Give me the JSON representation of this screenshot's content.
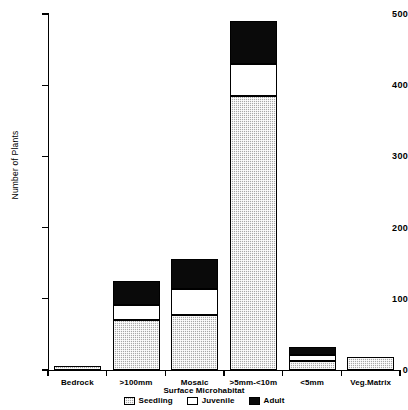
{
  "chart_data": {
    "type": "bar",
    "subtype": "stacked-bar",
    "title": "",
    "xlabel": "Surface Microhabitat",
    "ylabel": "Number of Plants",
    "categories": [
      "Bedrock",
      ">100mm",
      "Mosaic",
      ">5mm-<10m",
      "<5mm",
      "Veg.Matrix"
    ],
    "series": [
      {
        "name": "Seedling",
        "values": [
          6,
          70,
          77,
          385,
          13,
          18
        ],
        "color": "#a8a8a8",
        "pattern": "checker-hatch"
      },
      {
        "name": "Juvenile",
        "values": [
          0,
          21,
          37,
          45,
          8,
          0
        ],
        "color": "#ffffff",
        "pattern": "solid"
      },
      {
        "name": "Adult",
        "values": [
          0,
          34,
          42,
          60,
          11,
          0
        ],
        "color": "#0a0a0a",
        "pattern": "solid"
      }
    ],
    "totals": [
      6,
      125,
      156,
      490,
      32,
      18
    ],
    "ylim": [
      0,
      500
    ],
    "yticks": [
      0,
      100,
      200,
      300,
      400,
      500
    ],
    "ytick_labels": [
      "0",
      "100",
      "200",
      "300",
      "400",
      "500"
    ],
    "grid": false,
    "legend_position": "bottom-center",
    "legend_entries": [
      "Seedling",
      "Juvenile",
      "Adult"
    ]
  }
}
